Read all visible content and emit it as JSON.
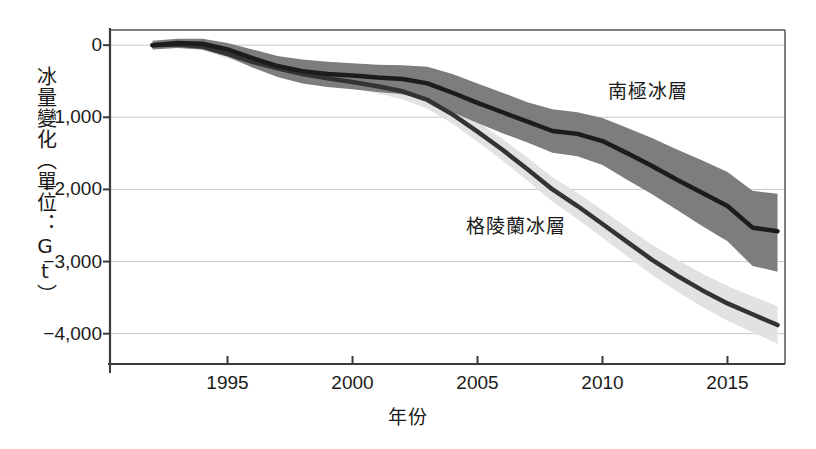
{
  "chart_data": {
    "type": "line",
    "title": "",
    "xlabel": "年份",
    "ylabel": "冰量變化（單位：Gt）",
    "xlim": [
      1990.3,
      2017.3
    ],
    "ylim": [
      -4420,
      210
    ],
    "grid": true,
    "legend_position": "inline-annotation",
    "x_ticks": [
      1995,
      2000,
      2005,
      2010,
      2015
    ],
    "x_tick_labels": [
      "1995",
      "2000",
      "2005",
      "2010",
      "2015"
    ],
    "y_ticks": [
      0,
      -1000,
      -2000,
      -3000,
      -4000
    ],
    "y_tick_labels": [
      "0",
      "−1,000",
      "−2,000",
      "−3,000",
      "−4,000"
    ],
    "x": [
      1992,
      1993,
      1994,
      1995,
      1996,
      1997,
      1998,
      1999,
      2000,
      2001,
      2002,
      2003,
      2004,
      2005,
      2006,
      2007,
      2008,
      2009,
      2010,
      2011,
      2012,
      2013,
      2014,
      2015,
      2016,
      2017
    ],
    "series": [
      {
        "name": "南極冰層",
        "label": "南極冰層",
        "color": "#1c1c1c",
        "band_color": "#7d7d7d",
        "values": [
          0,
          30,
          20,
          -60,
          -180,
          -290,
          -360,
          -400,
          -420,
          -450,
          -470,
          -530,
          -660,
          -800,
          -930,
          -1060,
          -1190,
          -1230,
          -1330,
          -1500,
          -1680,
          -1870,
          -2050,
          -2230,
          -2530,
          -2580
        ],
        "band_upper": [
          60,
          90,
          90,
          30,
          -60,
          -150,
          -200,
          -230,
          -250,
          -270,
          -280,
          -300,
          -400,
          -530,
          -660,
          -790,
          -890,
          -930,
          -1010,
          -1150,
          -1290,
          -1450,
          -1600,
          -1760,
          -2020,
          -2060
        ],
        "band_lower": [
          -60,
          -40,
          -60,
          -160,
          -310,
          -440,
          -530,
          -580,
          -610,
          -650,
          -680,
          -760,
          -930,
          -1080,
          -1220,
          -1350,
          -1490,
          -1540,
          -1660,
          -1870,
          -2070,
          -2290,
          -2510,
          -2720,
          -3060,
          -3140
        ]
      },
      {
        "name": "格陵蘭冰層",
        "label": "格陵蘭冰層",
        "color": "#333333",
        "band_color": "#e2e2e2",
        "values": [
          0,
          10,
          -20,
          -120,
          -230,
          -320,
          -400,
          -460,
          -510,
          -570,
          -640,
          -760,
          -960,
          -1200,
          -1450,
          -1720,
          -2000,
          -2230,
          -2480,
          -2730,
          -2980,
          -3200,
          -3400,
          -3580,
          -3730,
          -3880
        ],
        "band_upper": [
          40,
          50,
          30,
          -70,
          -170,
          -260,
          -330,
          -380,
          -420,
          -470,
          -530,
          -640,
          -830,
          -1060,
          -1300,
          -1560,
          -1830,
          -2050,
          -2290,
          -2530,
          -2770,
          -2980,
          -3170,
          -3340,
          -3480,
          -3620
        ],
        "band_lower": [
          -40,
          -30,
          -70,
          -180,
          -300,
          -390,
          -470,
          -540,
          -600,
          -670,
          -750,
          -880,
          -1090,
          -1340,
          -1600,
          -1880,
          -2170,
          -2410,
          -2670,
          -2930,
          -3190,
          -3420,
          -3630,
          -3820,
          -3980,
          -4140
        ]
      }
    ]
  },
  "axes": {
    "y_title": "冰量變化（單位：Gt）",
    "x_title": "年份"
  }
}
